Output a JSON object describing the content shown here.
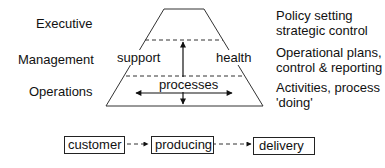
{
  "levels": [
    {
      "name": "Executive",
      "description": [
        "Policy setting",
        "strategic control"
      ]
    },
    {
      "name": "Management",
      "description": [
        "Operational plans,",
        "control & reporting"
      ]
    },
    {
      "name": "Operations",
      "description": [
        "Activities, process",
        "'doing'"
      ]
    }
  ],
  "pyramid": {
    "left_label": "support",
    "right_label": "health",
    "center_label": "processes"
  },
  "flow": {
    "steps": [
      "customer",
      "producing",
      "delivery"
    ]
  }
}
